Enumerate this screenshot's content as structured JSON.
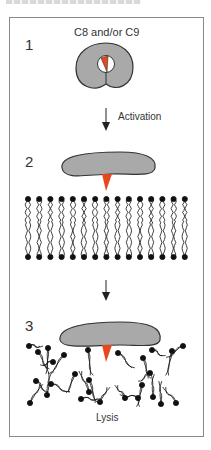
{
  "figure": {
    "header_text_cropped": "",
    "colors": {
      "protein": "#a9a9a9",
      "protein_outline": "#333333",
      "wedge": "#e8461c",
      "lipid": "#111111",
      "frame": "#8a8a8a"
    },
    "panels": [
      {
        "step": "1",
        "label": "C8 and/or C9",
        "state": "ring-shaped protein with red wedge"
      },
      {
        "step": "2",
        "label": "",
        "state": "elongated protein with wedge above intact lipid bilayer"
      },
      {
        "step": "3",
        "label": "Lysis",
        "state": "protein inserted into disrupted lipid bilayer"
      }
    ],
    "arrows": [
      {
        "from": "1",
        "to": "2",
        "label": "Activation"
      },
      {
        "from": "2",
        "to": "3",
        "label": ""
      }
    ]
  }
}
